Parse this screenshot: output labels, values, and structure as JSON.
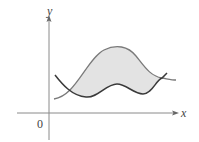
{
  "figure": {
    "labels": {
      "y_axis": "y",
      "x_axis": "x",
      "origin": "0"
    },
    "colors": {
      "background": "#ffffff",
      "axis": "#8a8a8a",
      "upper_curve": "#7a7a7a",
      "lower_curve": "#3a3a3a",
      "shaded_region": "#e3e3e3"
    }
  }
}
